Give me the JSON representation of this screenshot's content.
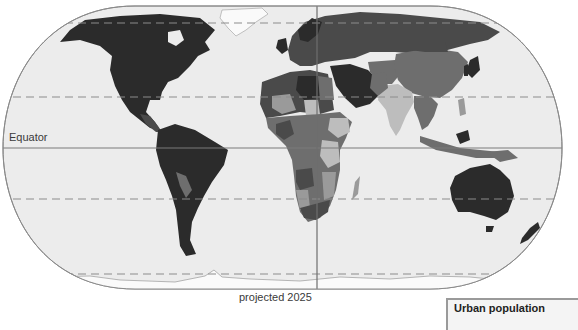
{
  "map": {
    "title": "Urban population",
    "caption": "projected 2025",
    "labels": {
      "equator": "Equator"
    },
    "projection": "Eckert-like pseudo-cylindrical (rounded frame)",
    "reference_lines": [
      {
        "name": "Arctic Circle",
        "style": "dashed"
      },
      {
        "name": "Tropic of Cancer",
        "style": "dashed"
      },
      {
        "name": "Equator",
        "style": "solid"
      },
      {
        "name": "Tropic of Capricorn",
        "style": "dashed"
      },
      {
        "name": "Antarctic Circle",
        "style": "dashed"
      },
      {
        "name": "Prime Meridian",
        "style": "solid"
      }
    ],
    "colors": {
      "ocean": "#ececec",
      "frame": "#8a8a8a",
      "grid": "#8c8c8c",
      "shade_darkest": "#2b2b2b",
      "shade_dark": "#4a4a4a",
      "shade_mid": "#6e6e6e",
      "shade_light": "#9a9a9a",
      "shade_lightest": "#bdbdbd",
      "ice": "#fafafa"
    },
    "regions": [
      {
        "name": "North America",
        "shade": "darkest"
      },
      {
        "name": "South America",
        "shade": "darkest"
      },
      {
        "name": "Europe",
        "shade": "dark"
      },
      {
        "name": "Russia",
        "shade": "dark"
      },
      {
        "name": "Middle East",
        "shade": "darkest"
      },
      {
        "name": "North Africa",
        "shade": "dark"
      },
      {
        "name": "Sub-Saharan Africa",
        "shade": "mid/light mix"
      },
      {
        "name": "China",
        "shade": "mid"
      },
      {
        "name": "India",
        "shade": "light"
      },
      {
        "name": "Southeast Asia",
        "shade": "mid"
      },
      {
        "name": "Australia",
        "shade": "darkest"
      },
      {
        "name": "New Zealand",
        "shade": "darkest"
      },
      {
        "name": "Greenland",
        "shade": "ice"
      },
      {
        "name": "Antarctica",
        "shade": "ice"
      }
    ]
  }
}
